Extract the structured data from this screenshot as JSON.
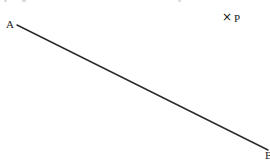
{
  "diagram": {
    "type": "geometry",
    "background": "#ffffff",
    "stroke_color": "#2a2a2a",
    "segment": {
      "name": "AB",
      "start": {
        "label": "A",
        "x": 17,
        "y": 25
      },
      "end": {
        "label": "B",
        "x": 268,
        "y": 150
      }
    },
    "points": [
      {
        "label": "P",
        "marker": "×",
        "x": 229,
        "y": 18
      }
    ]
  }
}
